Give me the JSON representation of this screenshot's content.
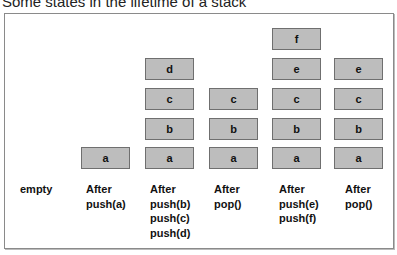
{
  "title": "Some states in the lifetime of a stack",
  "states": [
    {
      "label_lines": [
        "empty"
      ],
      "items": []
    },
    {
      "label_lines": [
        "After",
        "push(a)"
      ],
      "items": [
        "a"
      ]
    },
    {
      "label_lines": [
        "After",
        "push(b)",
        "push(c)",
        "push(d)"
      ],
      "items": [
        "a",
        "b",
        "c",
        "d"
      ]
    },
    {
      "label_lines": [
        "After",
        "pop()"
      ],
      "items": [
        "a",
        "b",
        "c"
      ]
    },
    {
      "label_lines": [
        "After",
        "push(e)",
        "push(f)"
      ],
      "items": [
        "a",
        "b",
        "c",
        "e",
        "f"
      ]
    },
    {
      "label_lines": [
        "After",
        "pop()"
      ],
      "items": [
        "a",
        "b",
        "c",
        "e"
      ]
    }
  ],
  "colors": {
    "box_fill": "#bdbdbd",
    "box_border": "#6f6f6f",
    "frame_border": "#8a8a8a"
  }
}
